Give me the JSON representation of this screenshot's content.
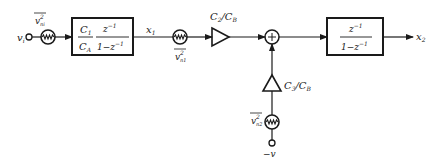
{
  "diagram": {
    "input": {
      "label": "v",
      "subscript": "i"
    },
    "noise_in": {
      "label": "v",
      "sup": "2",
      "sub": "ni"
    },
    "block1": {
      "gain_num": "C",
      "gain_num_sub": "1",
      "gain_den": "C",
      "gain_den_sub": "A",
      "tf_num": "z",
      "tf_num_sup": "−1",
      "tf_den": "1−z",
      "tf_den_sup": "−1"
    },
    "x1": {
      "label": "x",
      "sub": "1"
    },
    "noise_1": {
      "label": "v",
      "sup": "2",
      "sub": "n1"
    },
    "amp_top": {
      "label": "C",
      "sub1": "2",
      "slash": "/",
      "label2": "C",
      "sub2": "B"
    },
    "sum": {
      "symbol": "+"
    },
    "amp_bottom": {
      "label": "C",
      "sub1": "3",
      "slash": "/",
      "label2": "C",
      "sub2": "B"
    },
    "noise_2": {
      "label": "v",
      "sup": "2",
      "sub": "n2"
    },
    "ref": {
      "label": "−v"
    },
    "block2": {
      "tf_num": "z",
      "tf_num_sup": "−1",
      "tf_den": "1−z",
      "tf_den_sup": "−1"
    },
    "x2": {
      "label": "x",
      "sub": "2"
    }
  }
}
